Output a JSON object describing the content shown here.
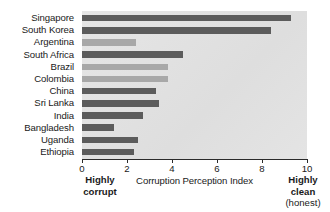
{
  "chart_data": {
    "type": "bar",
    "orientation": "horizontal",
    "title": "",
    "xlabel": "Corruption Perception Index",
    "ylabel": "",
    "xlim": [
      0,
      10
    ],
    "xticks": [
      0,
      2,
      4,
      6,
      8,
      10
    ],
    "xtick_labels": [
      "0",
      "2",
      "4",
      "6",
      "8",
      "10"
    ],
    "grid": false,
    "legend": null,
    "categories": [
      "Singapore",
      "South Korea",
      "Argentina",
      "South Africa",
      "Brazil",
      "Colombia",
      "China",
      "Sri Lanka",
      "India",
      "Bangladesh",
      "Uganda",
      "Ethiopia"
    ],
    "values": [
      9.3,
      8.4,
      2.4,
      4.5,
      3.8,
      3.8,
      3.3,
      3.4,
      2.7,
      1.4,
      2.5,
      2.3
    ],
    "bar_shades": [
      "dark",
      "dark",
      "light",
      "dark",
      "light",
      "light",
      "dark",
      "dark",
      "dark",
      "dark",
      "dark",
      "dark"
    ],
    "annotations": {
      "left_caption_line1": "Highly",
      "left_caption_line2": "corrupt",
      "right_caption_line1": "Highly",
      "right_caption_line2": "clean",
      "right_caption_line3": "(honest)"
    },
    "colors": {
      "bar_dark": "#5c5c5c",
      "bar_light": "#a8a8a8",
      "plot_background": "#e3e3e3",
      "axis": "#2b2b2b",
      "text": "#1a1a1a",
      "page_background": "#ffffff"
    }
  }
}
